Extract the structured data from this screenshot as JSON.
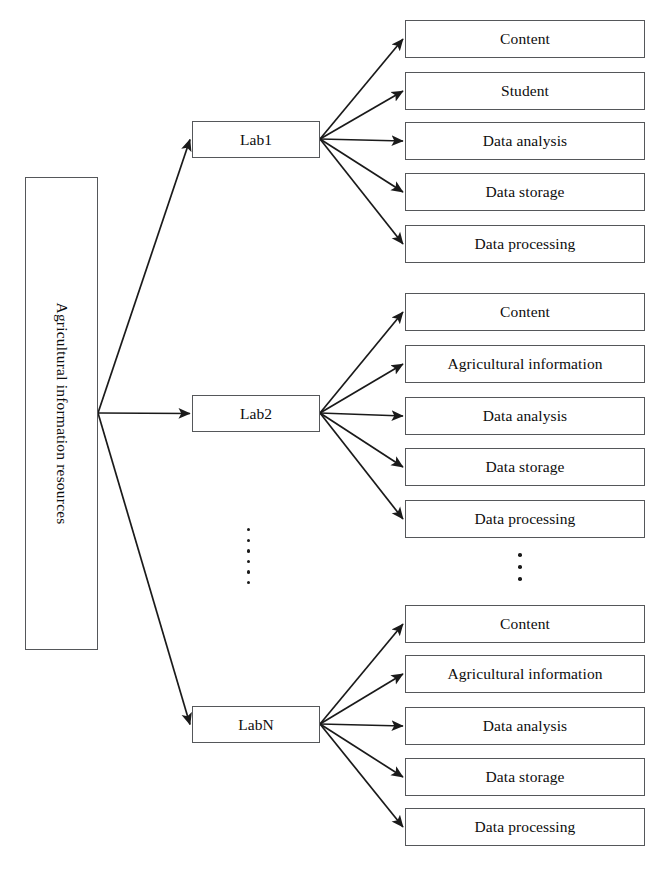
{
  "diagram": {
    "root": {
      "label": "Agricultural information resources",
      "x": 25,
      "y": 177,
      "width": 73,
      "height": 473
    },
    "junction": {
      "x": 98,
      "y": 413
    },
    "line_color": "#1a1a1a",
    "box_border_color": "#55575a",
    "background_color": "#ffffff",
    "lab_nodes": [
      {
        "label": "Lab1",
        "x": 192,
        "y": 121,
        "width": 128,
        "height": 37
      },
      {
        "label": "Lab2",
        "x": 192,
        "y": 395,
        "width": 128,
        "height": 37
      },
      {
        "label": "LabN",
        "x": 192,
        "y": 706,
        "width": 128,
        "height": 37
      }
    ],
    "leaf_groups": [
      {
        "lab": "Lab1",
        "fan_origin": {
          "x": 320,
          "y": 139
        },
        "items": [
          {
            "label": "Content",
            "x": 405,
            "y": 20,
            "width": 240,
            "height": 38
          },
          {
            "label": "Student",
            "x": 405,
            "y": 72,
            "width": 240,
            "height": 38
          },
          {
            "label": "Data analysis",
            "x": 405,
            "y": 122,
            "width": 240,
            "height": 38
          },
          {
            "label": "Data storage",
            "x": 405,
            "y": 173,
            "width": 240,
            "height": 38
          },
          {
            "label": "Data processing",
            "x": 405,
            "y": 225,
            "width": 240,
            "height": 38
          }
        ]
      },
      {
        "lab": "Lab2",
        "fan_origin": {
          "x": 320,
          "y": 413
        },
        "items": [
          {
            "label": "Content",
            "x": 405,
            "y": 293,
            "width": 240,
            "height": 38
          },
          {
            "label": "Agricultural information",
            "x": 405,
            "y": 345,
            "width": 240,
            "height": 38
          },
          {
            "label": "Data analysis",
            "x": 405,
            "y": 397,
            "width": 240,
            "height": 38
          },
          {
            "label": "Data storage",
            "x": 405,
            "y": 448,
            "width": 240,
            "height": 38
          },
          {
            "label": "Data processing",
            "x": 405,
            "y": 500,
            "width": 240,
            "height": 38
          }
        ]
      },
      {
        "lab": "LabN",
        "fan_origin": {
          "x": 320,
          "y": 724
        },
        "items": [
          {
            "label": "Content",
            "x": 405,
            "y": 605,
            "width": 240,
            "height": 38
          },
          {
            "label": "Agricultural information",
            "x": 405,
            "y": 655,
            "width": 240,
            "height": 38
          },
          {
            "label": "Data analysis",
            "x": 405,
            "y": 707,
            "width": 240,
            "height": 38
          },
          {
            "label": "Data storage",
            "x": 405,
            "y": 758,
            "width": 240,
            "height": 38
          },
          {
            "label": "Data processing",
            "x": 405,
            "y": 808,
            "width": 240,
            "height": 38
          }
        ]
      }
    ],
    "ellipsis": [
      {
        "name": "lab-column-ellipsis",
        "x": 247,
        "y": 528,
        "dots": 6
      },
      {
        "name": "leaf-column-ellipsis",
        "x": 518,
        "y": 553,
        "dots": 3
      }
    ]
  }
}
